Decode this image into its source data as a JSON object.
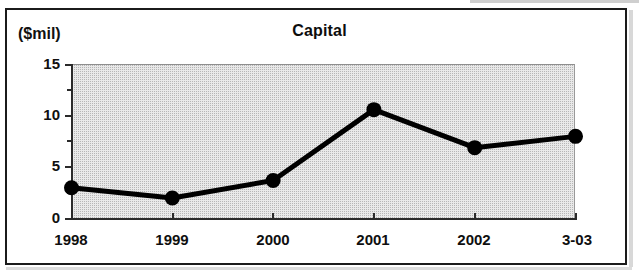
{
  "chart_data": {
    "type": "line",
    "title": "Capital",
    "xlabel": "",
    "ylabel": "($mil)",
    "categories": [
      "1998",
      "1999",
      "2000",
      "2001",
      "2002",
      "3-03"
    ],
    "values": [
      3.0,
      2.0,
      3.7,
      10.6,
      6.9,
      8.0
    ],
    "series": [
      {
        "name": "Capital",
        "values": [
          3.0,
          2.0,
          3.7,
          10.6,
          6.9,
          8.0
        ]
      }
    ],
    "ylim": [
      0,
      15
    ],
    "ytick_labels": [
      "0",
      "5",
      "10",
      "15"
    ],
    "ytick_values": [
      0,
      5,
      10,
      15
    ],
    "yminor_values": [
      2.5,
      7.5,
      12.5
    ],
    "grid": false,
    "legend": "none",
    "marker": "filled-circle",
    "line_color": "#000000",
    "plot_background": "#e9e9e9"
  },
  "labels": {
    "unit": "($mil)",
    "title": "Capital",
    "y0": "0",
    "y5": "5",
    "y10": "10",
    "y15": "15",
    "x0": "1998",
    "x1": "1999",
    "x2": "2000",
    "x3": "2001",
    "x4": "2002",
    "x5": "3-03"
  },
  "colors": {
    "frame": "#1b1b1b",
    "axis": "#2a2a2a",
    "line": "#000000",
    "marker": "#000000",
    "plot_fill": "#e9e9e9",
    "page": "#ffffff"
  }
}
